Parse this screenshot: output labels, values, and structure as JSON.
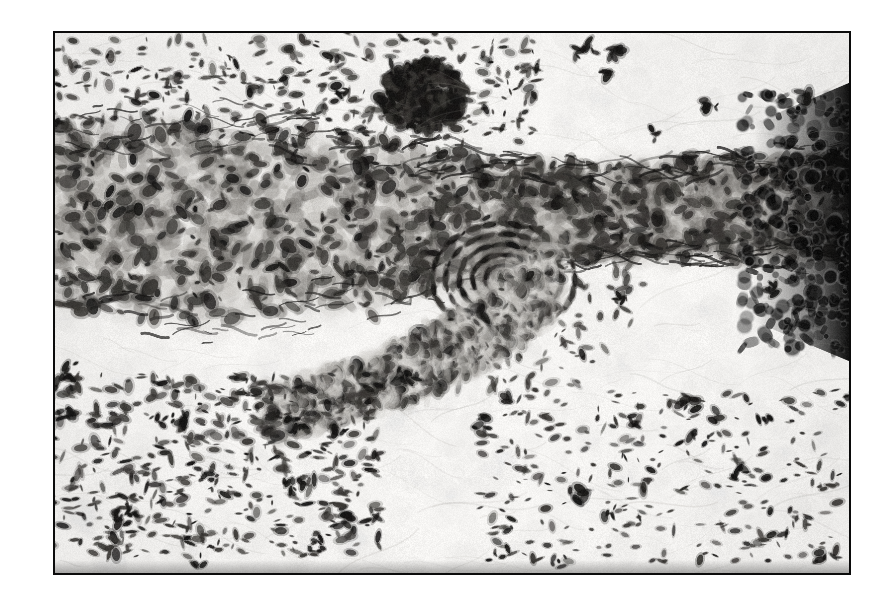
{
  "figure": {
    "kind": "histopathology-micrograph",
    "stain": "hematoxylin-and-eosin",
    "rendering": "grayscale halftone print",
    "caption": "",
    "label": "",
    "scale_bar_text": "",
    "magnification_text": ""
  },
  "plate": {
    "x": 53,
    "y": 31,
    "width": 798,
    "height": 544,
    "border_color": "#0b0b0b",
    "border_width_px": 2,
    "page_background": "#ffffff",
    "field_background": "#fdfdfc"
  },
  "palette": {
    "paper_white": "#ffffff",
    "field_pale": "#f7f6f4",
    "tissue_light": "#d8d6d2",
    "tissue_mid": "#a7a49f",
    "tissue_dark": "#6d6a66",
    "nucleus": "#3a3835",
    "nucleus_deep": "#171615",
    "near_black": "#080808",
    "frame": "#0b0b0b"
  },
  "regions": [
    {
      "name": "upper-sparse-stroma",
      "description": "pale loose connective tissue in the upper field with scattered spindle-shaped nuclei",
      "cx": 0.3,
      "cy": 0.1,
      "w": 0.62,
      "h": 0.18,
      "density": "sparse"
    },
    {
      "name": "dense-cellular-band",
      "description": "broad horizontal band of densely packed cells crossing the field",
      "cx": 0.5,
      "cy": 0.33,
      "w": 1.02,
      "h": 0.26,
      "density": "dense"
    },
    {
      "name": "dark-nodule-upper",
      "description": "compact dark-staining cell cluster above the band",
      "cx": 0.465,
      "cy": 0.118,
      "w": 0.105,
      "h": 0.125,
      "density": "very-dense"
    },
    {
      "name": "vessel-whorl",
      "description": "rounded whorled vessel-like structure with concentric nuclei below band centre",
      "cx": 0.565,
      "cy": 0.455,
      "w": 0.125,
      "h": 0.145,
      "density": "very-dense"
    },
    {
      "name": "descending-tail",
      "description": "curved cellular tail sweeping down and left from the band",
      "cx": 0.44,
      "cy": 0.58,
      "w": 0.34,
      "h": 0.24,
      "density": "moderate"
    },
    {
      "name": "right-margin-dark-edge",
      "description": "near-black over-stained strip at the right margin of the band",
      "cx": 0.985,
      "cy": 0.35,
      "w": 0.05,
      "h": 0.28,
      "density": "black"
    },
    {
      "name": "lower-left-scatter",
      "description": "pale area with evenly scattered elongated nuclei, lower left quadrant",
      "cx": 0.2,
      "cy": 0.8,
      "w": 0.42,
      "h": 0.34,
      "density": "moderate"
    },
    {
      "name": "lower-right-scatter",
      "description": "very pale area with sparse nuclei, lower right quadrant",
      "cx": 0.76,
      "cy": 0.82,
      "w": 0.46,
      "h": 0.32,
      "density": "sparse"
    }
  ],
  "seeds": {
    "field": 20240517,
    "nuclei": 991733,
    "texture": 553311
  },
  "counts": {
    "nuclei_total": 1450,
    "band_clumps": 320,
    "fiber_strokes": 210
  }
}
